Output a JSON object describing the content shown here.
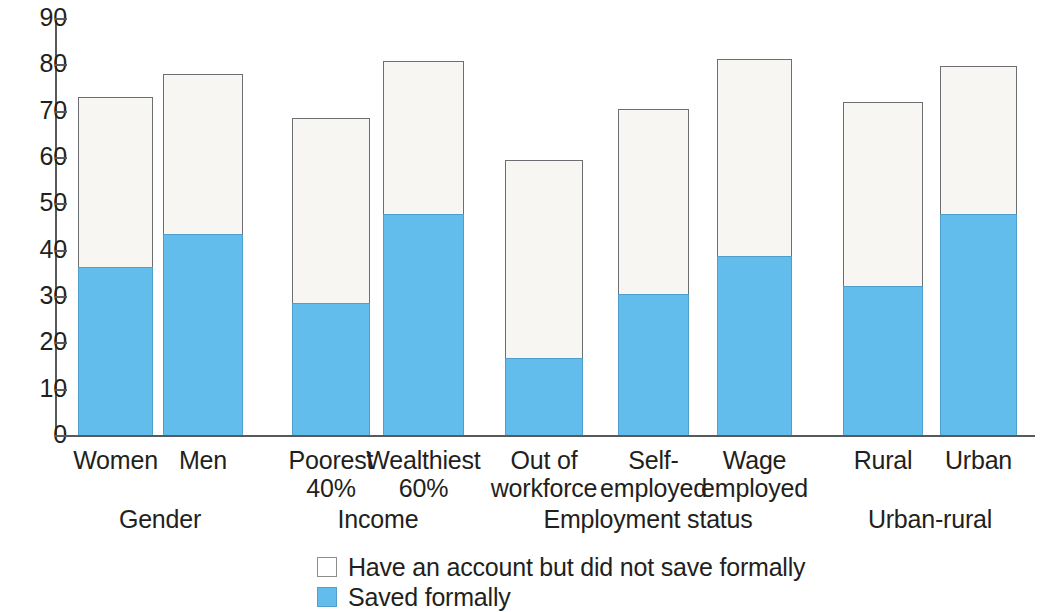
{
  "chart_data": {
    "type": "bar",
    "subtype": "stacked-bar-grouped",
    "title": "",
    "subtitle": "",
    "xlabel": "",
    "ylabel": "",
    "ylim": [
      0,
      90
    ],
    "y_ticks": [
      0,
      10,
      20,
      30,
      40,
      50,
      60,
      70,
      80,
      90
    ],
    "y_tick_labels": [
      "0",
      "10",
      "20",
      "30",
      "40",
      "50",
      "60",
      "70",
      "80",
      "90"
    ],
    "grid": false,
    "legend_position": "bottom-center",
    "categories": [
      "Women",
      "Men",
      "Poorest 40%",
      "Wealthiest 60%",
      "Out of workforce",
      "Self-employed",
      "Wage employed",
      "Rural",
      "Urban"
    ],
    "series": [
      {
        "name": "Saved formally",
        "color": "#63bdec",
        "values": [
          36.3,
          43.3,
          28.4,
          47.7,
          16.7,
          30.5,
          38.7,
          32.1,
          47.7
        ]
      },
      {
        "name": "Have an account but did not save formally",
        "color": "#f7f6f3",
        "values": [
          36.7,
          34.7,
          40.0,
          33.1,
          42.7,
          39.9,
          42.5,
          39.7,
          31.9
        ]
      }
    ],
    "totals": [
      73.0,
      78.0,
      68.4,
      80.8,
      59.4,
      70.4,
      81.2,
      71.8,
      79.6
    ],
    "groups": [
      {
        "label": "Gender",
        "categories": [
          "Women",
          "Men"
        ]
      },
      {
        "label": "Income",
        "categories": [
          "Poorest 40%",
          "Wealthiest 60%"
        ]
      },
      {
        "label": "Employment status",
        "categories": [
          "Out of workforce",
          "Self-employed",
          "Wage employed"
        ]
      },
      {
        "label": "Urban-rural",
        "categories": [
          "Rural",
          "Urban"
        ]
      }
    ]
  },
  "axis": {
    "y_labels": [
      "90",
      "80",
      "70",
      "60",
      "50",
      "40",
      "30",
      "20",
      "10",
      "0"
    ]
  },
  "bars": [
    {
      "label_line1": "Women",
      "label_line2": "",
      "total": 73.0,
      "saved": 36.3,
      "left": 78,
      "width": 75
    },
    {
      "label_line1": "Men",
      "label_line2": "",
      "total": 78.0,
      "saved": 43.3,
      "left": 163,
      "width": 80
    },
    {
      "label_line1": "Poorest",
      "label_line2": "40%",
      "total": 68.4,
      "saved": 28.4,
      "left": 292,
      "width": 78
    },
    {
      "label_line1": "Wealthiest",
      "label_line2": "60%",
      "total": 80.8,
      "saved": 47.7,
      "left": 383,
      "width": 81
    },
    {
      "label_line1": "Out of",
      "label_line2": "workforce",
      "total": 59.4,
      "saved": 16.7,
      "left": 505,
      "width": 78
    },
    {
      "label_line1": "Self-",
      "label_line2": "employed",
      "total": 70.4,
      "saved": 30.5,
      "left": 618,
      "width": 71
    },
    {
      "label_line1": "Wage",
      "label_line2": "employed",
      "total": 81.2,
      "saved": 38.7,
      "left": 717,
      "width": 75
    },
    {
      "label_line1": "Rural",
      "label_line2": "",
      "total": 71.8,
      "saved": 32.1,
      "left": 843,
      "width": 80
    },
    {
      "label_line1": "Urban",
      "label_line2": "",
      "total": 79.6,
      "saved": 47.7,
      "left": 940,
      "width": 77
    }
  ],
  "groups": [
    {
      "label": "Gender",
      "center": 160
    },
    {
      "label": "Income",
      "center": 378
    },
    {
      "label": "Employment status",
      "center": 648
    },
    {
      "label": "Urban-rural",
      "center": 930
    }
  ],
  "legend": {
    "items": [
      {
        "label": "Have an account but did not save formally",
        "swatch": "white",
        "color": "#ffffff"
      },
      {
        "label": "Saved formally",
        "swatch": "blue",
        "color": "#63bdec"
      }
    ]
  },
  "colors": {
    "saved_formally": "#63bdec",
    "account_no_save": "#f7f6f3",
    "axis": "#58595b",
    "text": "#231f20",
    "bar_outline": "#6d6e71"
  }
}
